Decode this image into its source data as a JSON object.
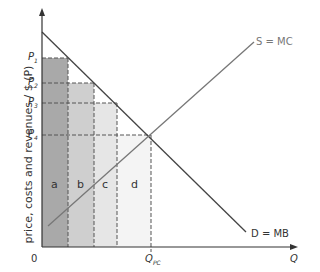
{
  "diagram": {
    "y_axis_label": "price, costs and revenues / $ (P)",
    "x_axis_label": "Q",
    "origin_label": "0",
    "supply_label": "S = MC",
    "demand_label": "D = MB",
    "price_labels": [
      "P",
      "P",
      "P",
      "P"
    ],
    "price_subs": [
      "1",
      "2",
      "3",
      "4"
    ],
    "quantity_label": "Q",
    "quantity_sub": "PC",
    "area_labels": [
      "a",
      "b",
      "c",
      "d"
    ],
    "area_colors": [
      "#a9a9a9",
      "#cfcfcf",
      "#e6e6e6",
      "#f4f4f4"
    ]
  }
}
